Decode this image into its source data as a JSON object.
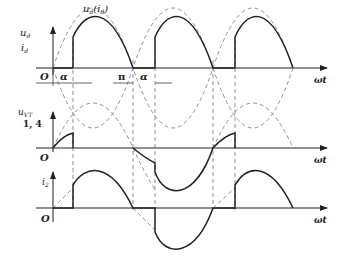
{
  "diagram": {
    "type": "waveform",
    "colors": {
      "ink": "#222222",
      "dashed": "#777777",
      "background": "#ffffff"
    },
    "panels": [
      {
        "id": "output",
        "y_label_top": "u",
        "y_label_top_sub": "d",
        "y_label_bottom": "i",
        "y_label_bottom_sub": "d",
        "curve_label": "u",
        "curve_label_sub": "d",
        "curve_label_paren": "(i",
        "curve_label_paren_sub": "d",
        "curve_label_close": ")",
        "origin": "O",
        "x_label": "ωt",
        "marks": {
          "alpha1": "α",
          "pi": "π",
          "alpha2": "α"
        }
      },
      {
        "id": "thyristor-voltage",
        "y_label": "u",
        "y_label_sub": "VT",
        "y_label_2": "1, 4",
        "origin": "O",
        "x_label": "ωt"
      },
      {
        "id": "supply-current",
        "y_label": "i",
        "y_label_sub": "2",
        "origin": "O",
        "x_label": "ωt"
      }
    ]
  }
}
